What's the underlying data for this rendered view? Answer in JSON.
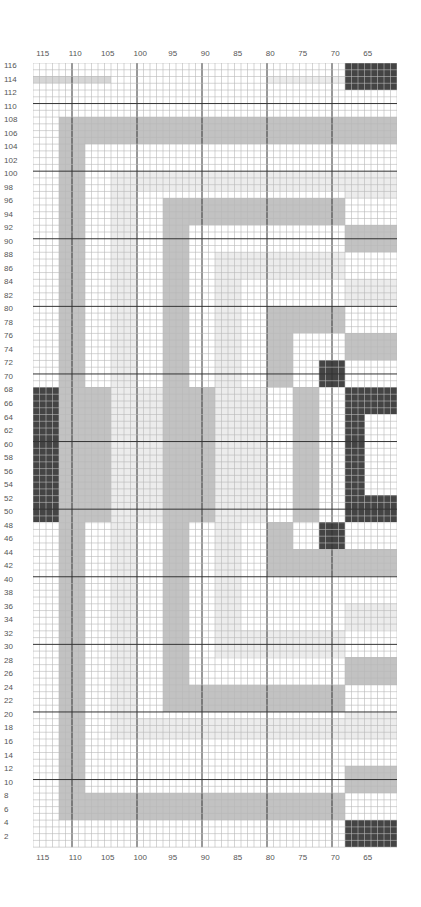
{
  "chart": {
    "title": "",
    "grid": {
      "columns": 56,
      "rows": 116,
      "col_start": 116,
      "row_start": 116,
      "major_every": 10
    },
    "colors": {
      "dark": "#444444",
      "mid": "#c2c2c2",
      "pale": "#ececec",
      "grid_minor": "#b8b8b8",
      "grid_major": "#333333"
    },
    "column_labels": [
      "115",
      "110",
      "105",
      "100",
      "95",
      "90",
      "85",
      "80",
      "75",
      "70",
      "65"
    ],
    "row_labels": [
      "116",
      "114",
      "112",
      "110",
      "108",
      "106",
      "104",
      "102",
      "100",
      "98",
      "96",
      "94",
      "92",
      "90",
      "88",
      "86",
      "84",
      "82",
      "80",
      "78",
      "76",
      "74",
      "72",
      "70",
      "68",
      "66",
      "64",
      "62",
      "60",
      "58",
      "56",
      "54",
      "52",
      "50",
      "48",
      "46",
      "44",
      "42",
      "40",
      "38",
      "36",
      "34",
      "32",
      "30",
      "28",
      "26",
      "24",
      "22",
      "20",
      "18",
      "16",
      "14",
      "12",
      "10",
      "8",
      "6",
      "4",
      "2"
    ]
  },
  "chart_data": {
    "type": "heatmap",
    "title": "",
    "xlabel": "",
    "ylabel": "",
    "x_ticks": [
      115,
      110,
      105,
      100,
      95,
      90,
      85,
      80,
      75,
      70,
      65
    ],
    "y_ticks": [
      116,
      114,
      112,
      110,
      108,
      106,
      104,
      102,
      100,
      98,
      96,
      94,
      92,
      90,
      88,
      86,
      84,
      82,
      80,
      78,
      76,
      74,
      72,
      70,
      68,
      66,
      64,
      62,
      60,
      58,
      56,
      54,
      52,
      50,
      48,
      46,
      44,
      42,
      40,
      38,
      36,
      34,
      32,
      30,
      28,
      26,
      24,
      22,
      20,
      18,
      16,
      14,
      12,
      10,
      8,
      6,
      4,
      2
    ],
    "xlim": [
      116,
      61
    ],
    "ylim": [
      1,
      116
    ],
    "grid": true,
    "legend": [],
    "blocks_note": "cells given as [col_index, row_index, width, height, tone]; col_index 0 = stitch 116 (left), row_index 0 = row 116 (top)",
    "blocks": [
      [
        48,
        0,
        8,
        4,
        "dark"
      ],
      [
        48,
        112,
        8,
        4,
        "dark"
      ],
      [
        44,
        44,
        4,
        4,
        "dark"
      ],
      [
        44,
        68,
        4,
        4,
        "dark"
      ],
      [
        0,
        48,
        4,
        20,
        "dark"
      ],
      [
        48,
        48,
        8,
        4,
        "dark"
      ],
      [
        48,
        64,
        8,
        4,
        "dark"
      ],
      [
        48,
        52,
        3,
        12,
        "dark"
      ],
      [
        4,
        8,
        44,
        4,
        "mid"
      ],
      [
        4,
        8,
        4,
        104,
        "mid"
      ],
      [
        4,
        108,
        44,
        4,
        "mid"
      ],
      [
        20,
        20,
        28,
        4,
        "mid"
      ],
      [
        20,
        20,
        4,
        76,
        "mid"
      ],
      [
        20,
        92,
        28,
        4,
        "mid"
      ],
      [
        36,
        36,
        12,
        4,
        "mid"
      ],
      [
        36,
        36,
        4,
        12,
        "mid"
      ],
      [
        36,
        68,
        4,
        8,
        "mid"
      ],
      [
        36,
        72,
        12,
        4,
        "mid"
      ],
      [
        8,
        48,
        4,
        20,
        "mid"
      ],
      [
        24,
        48,
        4,
        20,
        "mid"
      ],
      [
        40,
        48,
        4,
        20,
        "mid"
      ],
      [
        48,
        8,
        8,
        4,
        "mid"
      ],
      [
        48,
        24,
        8,
        4,
        "mid"
      ],
      [
        48,
        40,
        8,
        4,
        "mid"
      ],
      [
        48,
        72,
        8,
        4,
        "mid"
      ],
      [
        48,
        88,
        8,
        4,
        "mid"
      ],
      [
        48,
        104,
        8,
        4,
        "mid"
      ],
      [
        48,
        16,
        8,
        4,
        "pale"
      ],
      [
        48,
        32,
        8,
        4,
        "pale"
      ],
      [
        48,
        80,
        8,
        4,
        "pale"
      ],
      [
        48,
        96,
        8,
        4,
        "pale"
      ],
      [
        16,
        48,
        4,
        20,
        "pale"
      ],
      [
        28,
        48,
        4,
        20,
        "pale"
      ],
      [
        32,
        48,
        4,
        20,
        "pale"
      ],
      [
        12,
        16,
        4,
        84,
        "pale"
      ],
      [
        12,
        16,
        36,
        3,
        "pale"
      ],
      [
        12,
        97,
        36,
        3,
        "pale"
      ],
      [
        28,
        28,
        4,
        60,
        "pale"
      ],
      [
        28,
        28,
        20,
        4,
        "pale"
      ],
      [
        28,
        84,
        20,
        4,
        "pale"
      ],
      [
        0,
        2,
        12,
        1,
        "tint"
      ],
      [
        36,
        2,
        12,
        1,
        "pale"
      ]
    ]
  }
}
